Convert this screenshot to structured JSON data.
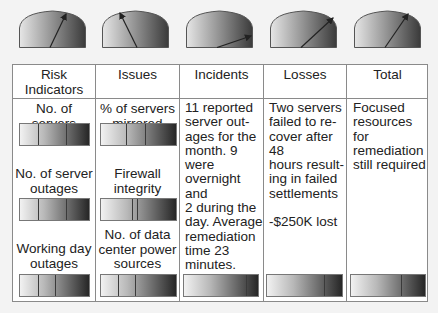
{
  "gauges": [
    {
      "name": "risk-indicators-gauge",
      "needle_angle_deg": 63
    },
    {
      "name": "issues-gauge",
      "needle_angle_deg": 118
    },
    {
      "name": "incidents-gauge",
      "needle_angle_deg": 15
    },
    {
      "name": "losses-gauge",
      "needle_angle_deg": 38
    },
    {
      "name": "total-gauge",
      "needle_angle_deg": 52
    }
  ],
  "table": {
    "headers": [
      "Risk\nIndicators",
      "Issues",
      "Incidents",
      "Losses",
      "Total"
    ],
    "header_risk_line1": "Risk",
    "header_risk_line2": "Indicators",
    "header_issues": "Issues",
    "header_incidents": "Incidents",
    "header_losses": "Losses",
    "header_total": "Total",
    "risk_indicators": {
      "item1": "No. of servers",
      "item2_line1": "No. of server",
      "item2_line2": "outages",
      "item3_line1": "Working day",
      "item3_line2": "outages"
    },
    "issues": {
      "item1_line1": "% of servers",
      "item1_line2": "mirrored",
      "item2_line1": "Firewall",
      "item2_line2": "integrity",
      "item3_line1": "No. of data",
      "item3_line2": "center power",
      "item3_line3": "sources"
    },
    "incidents": {
      "lines": [
        "11 reported",
        "server out-",
        "ages for the",
        "month. 9 were",
        "overnight and",
        "2 during the",
        "day.  Average",
        "remediation",
        "time 23",
        "minutes."
      ]
    },
    "losses": {
      "lines": [
        "Two servers",
        "failed to re-",
        "cover after 48",
        "hours result-",
        "ing in failed",
        "settlements"
      ],
      "amount": "-$250K lost"
    },
    "total": {
      "lines": [
        "Focused",
        "resources for",
        "remediation",
        "still required"
      ]
    }
  },
  "colors": {
    "background": "#f3f3f3",
    "border": "#8a8a8a",
    "gradient_light": "#f2f2f2",
    "gradient_dark": "#262626"
  }
}
